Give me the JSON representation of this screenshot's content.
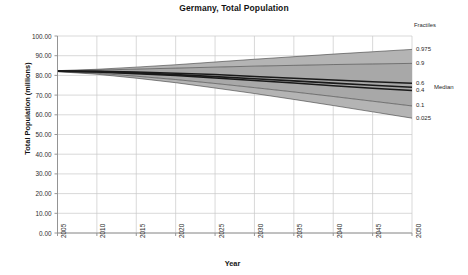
{
  "chart_data": {
    "type": "area",
    "title": "Germany, Total Population",
    "xlabel": "Year",
    "ylabel": "Total Population (millions)",
    "xlim": [
      2005,
      2050
    ],
    "ylim": [
      0,
      100
    ],
    "grid": true,
    "legend_position": "right",
    "legend_title": "Fractiles",
    "x": [
      2005,
      2010,
      2015,
      2020,
      2025,
      2030,
      2035,
      2040,
      2045,
      2050
    ],
    "series": [
      {
        "name": "0.975",
        "values": [
          82.4,
          83.1,
          84.2,
          85.4,
          86.8,
          88.2,
          89.5,
          90.8,
          92.0,
          93.2
        ]
      },
      {
        "name": "0.9",
        "values": [
          82.3,
          82.7,
          83.2,
          83.7,
          84.2,
          84.7,
          85.1,
          85.5,
          85.8,
          86.1
        ]
      },
      {
        "name": "0.6",
        "values": [
          82.2,
          82.1,
          81.7,
          81.1,
          80.4,
          79.5,
          78.6,
          77.7,
          76.8,
          76.0
        ]
      },
      {
        "name": "Median",
        "values": [
          82.2,
          81.9,
          81.3,
          80.4,
          79.4,
          78.3,
          77.2,
          76.1,
          75.0,
          74.0
        ]
      },
      {
        "name": "0.4",
        "values": [
          82.1,
          81.7,
          80.9,
          79.9,
          78.7,
          77.4,
          76.1,
          74.8,
          73.5,
          72.3
        ]
      },
      {
        "name": "0.1",
        "values": [
          82.0,
          81.1,
          79.6,
          77.9,
          75.9,
          73.8,
          71.6,
          69.3,
          66.9,
          64.5
        ]
      },
      {
        "name": "0.025",
        "values": [
          81.9,
          80.6,
          78.6,
          76.3,
          73.6,
          70.8,
          67.8,
          64.7,
          61.5,
          58.3
        ]
      }
    ],
    "yticks": [
      "0.00",
      "10.00",
      "20.00",
      "30.00",
      "40.00",
      "50.00",
      "60.00",
      "70.00",
      "80.00",
      "90.00",
      "100.00"
    ],
    "ytick_values": [
      0,
      10,
      20,
      30,
      40,
      50,
      60,
      70,
      80,
      90,
      100
    ],
    "xticks": [
      "2005",
      "2010",
      "2015",
      "2020",
      "2025",
      "2030",
      "2035",
      "2040",
      "2045",
      "2050"
    ],
    "xtick_values": [
      2005,
      2010,
      2015,
      2020,
      2025,
      2030,
      2035,
      2040,
      2045,
      2050
    ],
    "legend_entries": [
      {
        "label": "0.975",
        "value": 93.2
      },
      {
        "label": "0.9",
        "value": 86.1
      },
      {
        "label": "0.6",
        "value": 76.0
      },
      {
        "label": "0.4",
        "value": 72.3
      },
      {
        "label": "0.1",
        "value": 64.5
      },
      {
        "label": "0.025",
        "value": 58.3
      }
    ],
    "median_legend_label": "Median",
    "median_legend_value": 74.0,
    "colors": {
      "band_outer": "#b4b4b4",
      "band_inner": "#a8a8a8",
      "median_line": "#1a1a1a",
      "quartile_line": "#3c3c3c",
      "grid": "#c8c8c8",
      "axis": "#8c8c8c",
      "text": "#1a1a1a"
    }
  }
}
